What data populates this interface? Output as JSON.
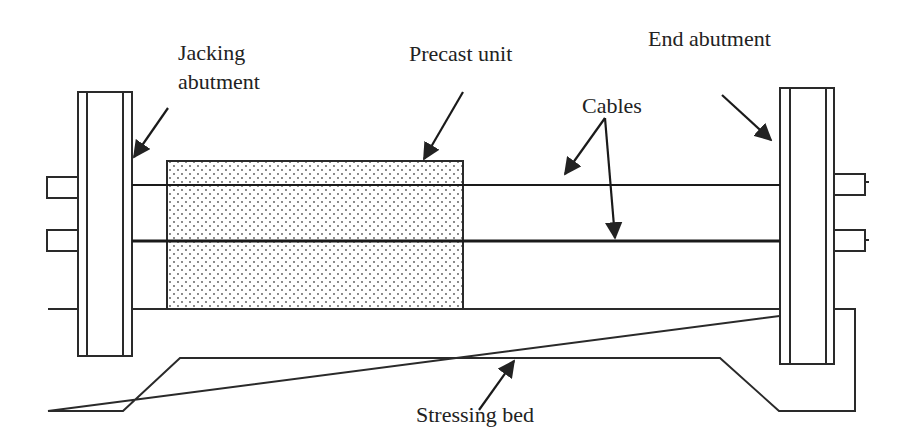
{
  "labels": {
    "jacking_abutment_line1": "Jacking",
    "jacking_abutment_line2": "abutment",
    "precast_unit": "Precast unit",
    "end_abutment": "End abutment",
    "cables": "Cables",
    "stressing_bed": "Stressing bed"
  },
  "components": [
    {
      "id": "jacking-abutment",
      "label": "Jacking abutment",
      "position": "left"
    },
    {
      "id": "precast-unit",
      "label": "Precast unit",
      "fill": "dotted"
    },
    {
      "id": "cables",
      "label": "Cables",
      "count": 2
    },
    {
      "id": "end-abutment",
      "label": "End abutment",
      "position": "right"
    },
    {
      "id": "stressing-bed",
      "label": "Stressing bed",
      "position": "bottom"
    }
  ],
  "colors": {
    "stroke": "#2a2a2a",
    "background": "#ffffff",
    "dot": "#555555"
  }
}
